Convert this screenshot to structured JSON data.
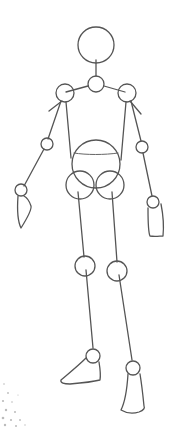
{
  "figure": {
    "stroke_color": "#555555",
    "background": "#ffffff"
  }
}
